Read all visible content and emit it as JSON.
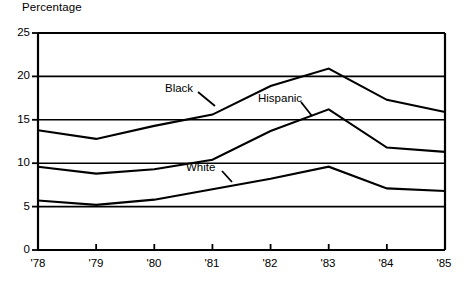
{
  "chart_data": {
    "type": "line",
    "title": "",
    "ylabel": "Percentage",
    "xlabel": "",
    "grid": true,
    "legend_position": "inline-annotations",
    "x": [
      "'78",
      "'79",
      "'80",
      "'81",
      "'82",
      "'83",
      "'84",
      "'85"
    ],
    "xlim": [
      0,
      7
    ],
    "ylim": [
      0,
      25
    ],
    "ytick_labels": [
      "0",
      "5",
      "10",
      "15",
      "20",
      "25"
    ],
    "ytick_values": [
      0,
      5,
      10,
      15,
      20,
      25
    ],
    "series": [
      {
        "name": "Black",
        "values": [
          13.8,
          12.8,
          14.3,
          15.6,
          18.9,
          20.9,
          17.3,
          15.9
        ]
      },
      {
        "name": "Hispanic",
        "values": [
          9.6,
          8.8,
          9.3,
          10.4,
          13.7,
          16.2,
          11.8,
          11.3
        ]
      },
      {
        "name": "White",
        "values": [
          5.7,
          5.2,
          5.8,
          7.0,
          8.2,
          9.6,
          7.1,
          6.8
        ]
      }
    ],
    "annotations": [
      {
        "text": "Black",
        "x_px": 165,
        "y_px": 89
      },
      {
        "text": "Hispanic",
        "x_px": 258,
        "y_px": 99
      },
      {
        "text": "White",
        "x_px": 186,
        "y_px": 168
      }
    ],
    "colors": {
      "line": "#000000",
      "grid": "#000000",
      "axis": "#000000",
      "background": "#ffffff"
    }
  }
}
